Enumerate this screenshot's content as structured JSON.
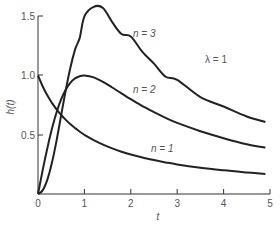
{
  "chart_data": {
    "type": "line",
    "title": "",
    "xlabel": "t",
    "ylabel": "h(t)",
    "xlim": [
      0,
      5
    ],
    "ylim": [
      0,
      1.5
    ],
    "x_ticks": [
      "0",
      "1",
      "2",
      "3",
      "4",
      "5"
    ],
    "y_ticks": [
      "0.5",
      "1.0",
      "1.5"
    ],
    "grid": false,
    "legend": "none (inline curve labels)",
    "annotations": [
      {
        "text": "λ = 1",
        "x": 3.8,
        "y": 1.1
      },
      {
        "text": "n = 3",
        "x": 2.2,
        "y": 1.32
      },
      {
        "text": "n = 2",
        "x": 2.2,
        "y": 0.86
      },
      {
        "text": "n = 1",
        "x": 2.2,
        "y": 0.38
      }
    ],
    "x": [
      0,
      0.1,
      0.2,
      0.3,
      0.4,
      0.5,
      0.6,
      0.7,
      0.8,
      0.9,
      1.0,
      1.2,
      1.4,
      1.6,
      1.8,
      2.0,
      2.25,
      2.5,
      2.75,
      3.0,
      3.5,
      4.0,
      4.5,
      4.9
    ],
    "series": [
      {
        "name": "n = 1",
        "values": [
          1.0,
          0.909,
          0.833,
          0.769,
          0.714,
          0.667,
          0.625,
          0.588,
          0.556,
          0.526,
          0.5,
          0.455,
          0.417,
          0.385,
          0.357,
          0.333,
          0.308,
          0.286,
          0.267,
          0.25,
          0.222,
          0.2,
          0.182,
          0.169
        ]
      },
      {
        "name": "n = 2",
        "values": [
          0.0,
          0.198,
          0.385,
          0.55,
          0.69,
          0.8,
          0.882,
          0.94,
          0.976,
          0.994,
          1.0,
          0.984,
          0.946,
          0.899,
          0.849,
          0.8,
          0.742,
          0.69,
          0.643,
          0.6,
          0.53,
          0.471,
          0.42,
          0.392
        ]
      },
      {
        "name": "n = 3",
        "values": [
          0.0,
          0.03,
          0.119,
          0.263,
          0.452,
          0.667,
          0.88,
          1.07,
          1.22,
          1.32,
          1.5,
          1.58,
          1.57,
          1.45,
          1.35,
          1.33,
          1.2,
          1.1,
          0.99,
          0.964,
          0.818,
          0.738,
          0.654,
          0.608
        ]
      }
    ]
  },
  "labels": {
    "ylabel": "h(t)",
    "xlabel": "t",
    "lambda": "λ = 1",
    "n3": "n = 3",
    "n2": "n = 2",
    "n1": "n = 1",
    "xt0": "0",
    "xt1": "1",
    "xt2": "2",
    "xt3": "3",
    "xt4": "4",
    "xt5": "5",
    "yt05": "0.5",
    "yt10": "1.0",
    "yt15": "1.5"
  }
}
